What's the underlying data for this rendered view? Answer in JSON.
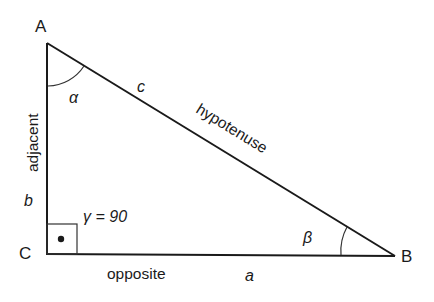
{
  "diagram": {
    "vertices": {
      "A": {
        "label": "A"
      },
      "B": {
        "label": "B"
      },
      "C": {
        "label": "C"
      }
    },
    "sides": {
      "c": {
        "letter": "c",
        "name": "hypotenuse"
      },
      "b": {
        "letter": "b",
        "name": "adjacent"
      },
      "a": {
        "letter": "a",
        "name": "opposite"
      }
    },
    "angles": {
      "alpha": {
        "label": "α"
      },
      "beta": {
        "label": "β"
      },
      "gamma": {
        "label": "γ = 90"
      }
    },
    "colors": {
      "stroke": "#1a1a1a",
      "background": "#ffffff"
    }
  }
}
